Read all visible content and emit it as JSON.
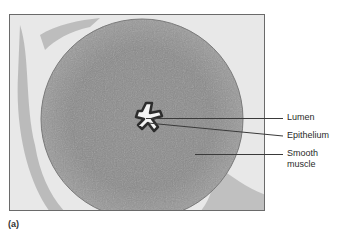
{
  "figure": {
    "panel_label": "(a)",
    "labels": [
      {
        "text": "Lumen"
      },
      {
        "text": "Epithelium"
      },
      {
        "text": "Smooth\nmuscle",
        "line1": "Smooth",
        "line2": "muscle"
      }
    ]
  }
}
